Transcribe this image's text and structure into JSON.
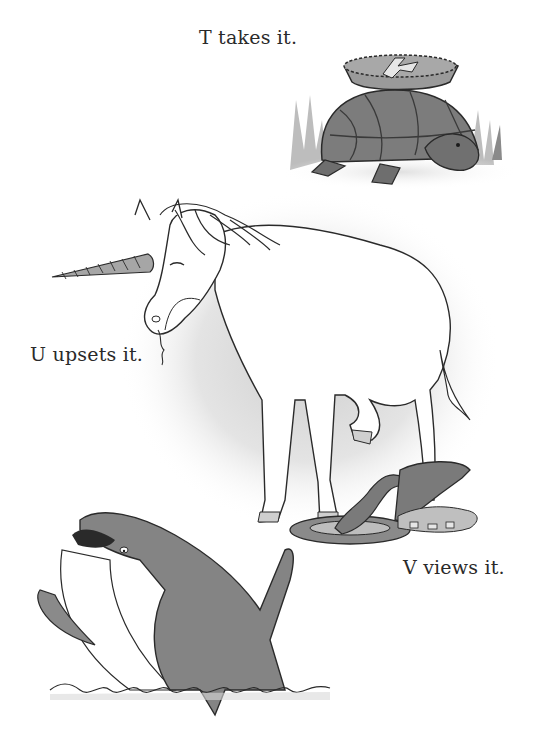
{
  "page": {
    "type": "alphabet-book-page",
    "background": "#ffffff",
    "ink_color": "#2a2a2a",
    "fill_gray": "#8a8a8a",
    "wash_gray": "#d4d4d4"
  },
  "entries": [
    {
      "letter": "T",
      "caption": "T takes it.",
      "subject": "turtle",
      "illustration": "turtle carrying a pie marked with the letter A on its shell, grass behind"
    },
    {
      "letter": "U",
      "caption": "U upsets it.",
      "subject": "unicorn",
      "illustration": "white unicorn with spiral horn, lifting a hoof, pie crumbs from its mouth"
    },
    {
      "letter": "V",
      "caption": "V views it.",
      "subject": "viper",
      "illustration": "coiled viper looking at an overturned pie tin with spilled crumbs"
    },
    {
      "letter": "W",
      "caption": "",
      "subject": "whale",
      "illustration": "gray whale rising from waves with open mouth"
    }
  ],
  "pie_mark": "A"
}
